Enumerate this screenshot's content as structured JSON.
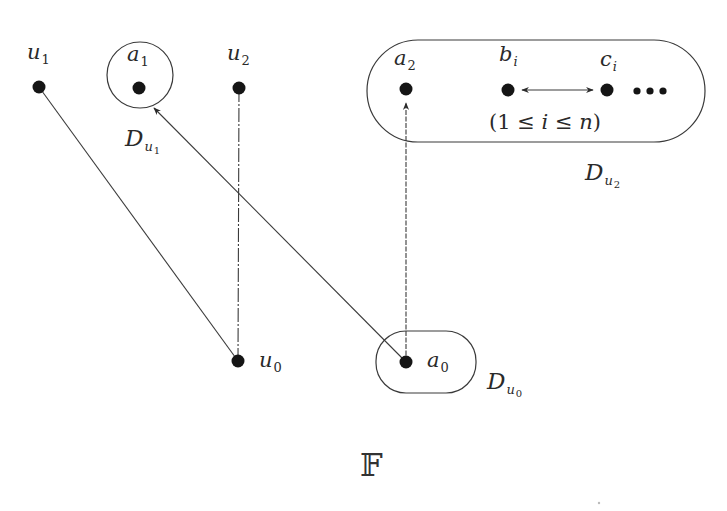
{
  "figure": {
    "title": "𝔽",
    "nodes": [
      {
        "id": "u1",
        "label": "u",
        "sub": "1",
        "x": 39,
        "y": 87
      },
      {
        "id": "a1",
        "label": "a",
        "sub": "1",
        "x": 139,
        "y": 88
      },
      {
        "id": "u2",
        "label": "u",
        "sub": "2",
        "x": 239,
        "y": 88
      },
      {
        "id": "a2",
        "label": "a",
        "sub": "2",
        "x": 406,
        "y": 89
      },
      {
        "id": "bi",
        "label": "b",
        "sub": "i",
        "x": 508,
        "y": 90
      },
      {
        "id": "ci",
        "label": "c",
        "sub": "i",
        "x": 607,
        "y": 90
      },
      {
        "id": "u0",
        "label": "u",
        "sub": "0",
        "x": 238,
        "y": 361
      },
      {
        "id": "a0",
        "label": "a",
        "sub": "0",
        "x": 406,
        "y": 362
      }
    ],
    "ellipsis": "•••",
    "condition": {
      "open": "(1 ≤ ",
      "var": "i",
      "mid": " ≤ ",
      "n": "n",
      "close": ")"
    },
    "regions": [
      {
        "id": "Du1",
        "label": "D",
        "sub": "u",
        "subsub": "1",
        "shape": "circle"
      },
      {
        "id": "Du2",
        "label": "D",
        "sub": "u",
        "subsub": "2",
        "shape": "pill"
      },
      {
        "id": "Du0",
        "label": "D",
        "sub": "u",
        "subsub": "0",
        "shape": "rounded-rect"
      }
    ],
    "edges": [
      {
        "from": "u1",
        "to": "u0",
        "style": "solid",
        "arrow": "none"
      },
      {
        "from": "u2",
        "to": "u0",
        "style": "dash-dot",
        "arrow": "none"
      },
      {
        "from": "a0",
        "to": "a1",
        "style": "solid",
        "arrow": "end"
      },
      {
        "from": "a0",
        "to": "a2",
        "style": "dotted",
        "arrow": "end"
      },
      {
        "from": "bi",
        "to": "ci",
        "style": "solid",
        "arrow": "both"
      }
    ],
    "colors": {
      "ink": "#1a1a1a",
      "line": "#3a3a3a",
      "background": "#ffffff"
    }
  }
}
